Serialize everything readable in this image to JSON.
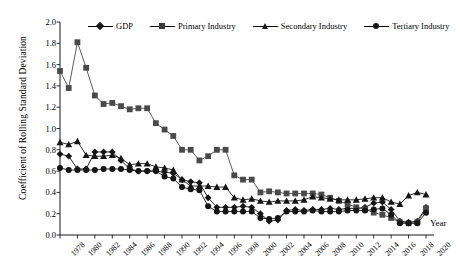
{
  "chart_data": {
    "type": "line",
    "title": "",
    "xlabel": "Year",
    "ylabel": "Coefficient of Rolling Standard Deviation",
    "xlim": [
      1978,
      2020
    ],
    "ylim": [
      0.0,
      2.0
    ],
    "ytick_step": 0.2,
    "xtick_step": 2,
    "grid": false,
    "legend_position": "top",
    "yticks": [
      "0.0",
      "0.2",
      "0.4",
      "0.6",
      "0.8",
      "1.0",
      "1.2",
      "1.4",
      "1.6",
      "1.8",
      "2.0"
    ],
    "xticks": [
      "1978",
      "1980",
      "1982",
      "1984",
      "1986",
      "1988",
      "1990",
      "1992",
      "1994",
      "1996",
      "1998",
      "2000",
      "2002",
      "2004",
      "2006",
      "2008",
      "2010",
      "2012",
      "2014",
      "2016",
      "2018",
      "2020"
    ],
    "x": [
      1978,
      1979,
      1980,
      1981,
      1982,
      1983,
      1984,
      1985,
      1986,
      1987,
      1988,
      1989,
      1990,
      1991,
      1992,
      1993,
      1994,
      1995,
      1996,
      1997,
      1998,
      1999,
      2000,
      2001,
      2002,
      2003,
      2004,
      2005,
      2006,
      2007,
      2008,
      2009,
      2010,
      2011,
      2012,
      2013,
      2014,
      2015,
      2016,
      2017,
      2018,
      2019,
      2020
    ],
    "series": [
      {
        "name": "GDP",
        "marker": "diamond",
        "values": [
          0.76,
          0.74,
          0.62,
          0.62,
          0.78,
          0.78,
          0.78,
          0.7,
          0.62,
          0.6,
          0.6,
          0.6,
          0.59,
          0.58,
          0.52,
          0.5,
          0.49,
          0.35,
          0.26,
          0.26,
          0.26,
          0.27,
          0.26,
          0.2,
          0.13,
          0.14,
          0.23,
          0.24,
          0.23,
          0.24,
          0.24,
          0.25,
          0.24,
          0.25,
          0.25,
          0.26,
          0.3,
          0.31,
          0.24,
          0.13,
          0.12,
          0.13,
          0.26
        ]
      },
      {
        "name": "Primary Industry",
        "marker": "square",
        "values": [
          1.54,
          1.38,
          1.81,
          1.57,
          1.31,
          1.23,
          1.24,
          1.21,
          1.18,
          1.19,
          1.19,
          1.05,
          0.99,
          0.93,
          0.8,
          0.8,
          0.7,
          0.74,
          0.8,
          0.8,
          0.56,
          0.52,
          0.52,
          0.4,
          0.41,
          0.4,
          0.39,
          0.39,
          0.39,
          0.39,
          0.38,
          0.35,
          0.32,
          0.29,
          0.26,
          0.24,
          0.21,
          0.19,
          0.16,
          0.12,
          0.11,
          0.12,
          0.25
        ]
      },
      {
        "name": "Secondary Industry",
        "marker": "triangle",
        "values": [
          0.87,
          0.85,
          0.88,
          0.75,
          0.74,
          0.74,
          0.75,
          0.72,
          0.66,
          0.67,
          0.67,
          0.64,
          0.63,
          0.61,
          0.52,
          0.46,
          0.46,
          0.46,
          0.45,
          0.45,
          0.35,
          0.33,
          0.34,
          0.32,
          0.31,
          0.32,
          0.32,
          0.32,
          0.33,
          0.36,
          0.35,
          0.34,
          0.33,
          0.33,
          0.33,
          0.34,
          0.35,
          0.35,
          0.31,
          0.29,
          0.37,
          0.4,
          0.38
        ]
      },
      {
        "name": "Tertiary Industry",
        "marker": "circle",
        "values": [
          0.63,
          0.61,
          0.61,
          0.61,
          0.61,
          0.62,
          0.62,
          0.62,
          0.61,
          0.6,
          0.6,
          0.6,
          0.55,
          0.53,
          0.45,
          0.43,
          0.42,
          0.27,
          0.22,
          0.22,
          0.22,
          0.22,
          0.22,
          0.16,
          0.15,
          0.16,
          0.22,
          0.22,
          0.22,
          0.23,
          0.22,
          0.22,
          0.22,
          0.23,
          0.23,
          0.23,
          0.24,
          0.25,
          0.19,
          0.11,
          0.11,
          0.11,
          0.21
        ]
      }
    ]
  },
  "legend": {
    "items": [
      {
        "label": "GDP",
        "marker": "diamond"
      },
      {
        "label": "Primary Industry",
        "marker": "square"
      },
      {
        "label": "Secondary Industry",
        "marker": "triangle"
      },
      {
        "label": "Tertiary Industry",
        "marker": "circle"
      }
    ]
  },
  "axis_titles": {
    "y": "Coefficient of Rolling Standard Deviation",
    "x": "Year"
  }
}
